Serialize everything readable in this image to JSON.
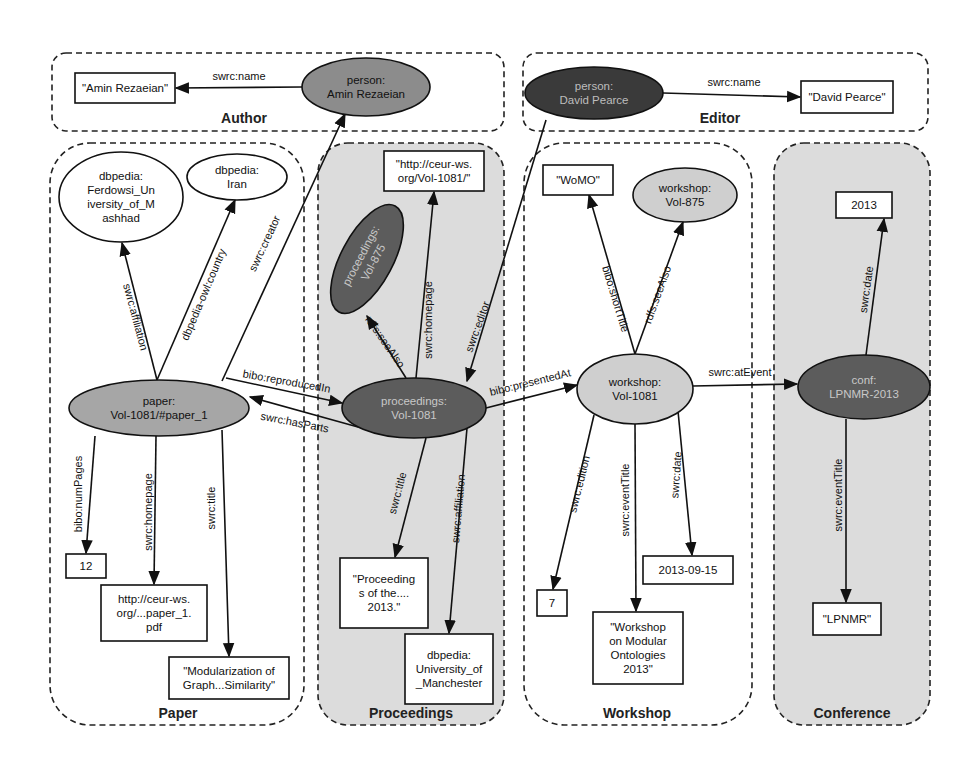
{
  "groups": [
    {
      "id": "author",
      "label": "Author",
      "fill": "#ffffff"
    },
    {
      "id": "editor",
      "label": "Editor",
      "fill": "#ffffff"
    },
    {
      "id": "paper",
      "label": "Paper",
      "fill": "#ffffff"
    },
    {
      "id": "proceedings",
      "label": "Proceedings",
      "fill": "#dcdcdc"
    },
    {
      "id": "workshop",
      "label": "Workshop",
      "fill": "#ffffff"
    },
    {
      "id": "conference",
      "label": "Conference",
      "fill": "#dcdcdc"
    }
  ],
  "nodes": [
    {
      "id": "amin-literal",
      "shape": "rect",
      "lines": [
        "\"Amin Rezaeian\""
      ],
      "fill": "#ffffff",
      "text_color": "#111111"
    },
    {
      "id": "person-amin",
      "shape": "ellipse",
      "lines": [
        "person:",
        "Amin Rezaeian"
      ],
      "fill": "#8c8c8c",
      "text_color": "#111111"
    },
    {
      "id": "person-david",
      "shape": "ellipse",
      "lines": [
        "person:",
        "David Pearce"
      ],
      "fill": "#3a3a3a",
      "text_color": "#bdbdbd"
    },
    {
      "id": "david-literal",
      "shape": "rect",
      "lines": [
        "\"David Pearce\""
      ],
      "fill": "#ffffff",
      "text_color": "#111111"
    },
    {
      "id": "ferdowsi",
      "shape": "ellipse",
      "lines": [
        "dbpedia:",
        "Ferdowsi_Un",
        "iversity_of_M",
        "ashhad"
      ],
      "fill": "#ffffff",
      "text_color": "#111111"
    },
    {
      "id": "iran",
      "shape": "ellipse",
      "lines": [
        "dbpedia:",
        "Iran"
      ],
      "fill": "#ffffff",
      "text_color": "#111111"
    },
    {
      "id": "paper",
      "shape": "ellipse",
      "lines": [
        "paper:",
        "Vol-1081/#paper_1"
      ],
      "fill": "#a6a6a6",
      "text_color": "#111111"
    },
    {
      "id": "num-pages",
      "shape": "rect",
      "lines": [
        "12"
      ],
      "fill": "#ffffff",
      "text_color": "#111111"
    },
    {
      "id": "paper-homepage",
      "shape": "rect",
      "lines": [
        "http://ceur-ws.",
        "org/...paper_1.",
        "pdf"
      ],
      "fill": "#ffffff",
      "text_color": "#111111"
    },
    {
      "id": "paper-title",
      "shape": "rect",
      "lines": [
        "\"Modularization of",
        "Graph...Similarity\""
      ],
      "fill": "#ffffff",
      "text_color": "#111111"
    },
    {
      "id": "proc-homepage",
      "shape": "rect",
      "lines": [
        "\"http://ceur-ws.",
        "org/Vol-1081/\""
      ],
      "fill": "#ffffff",
      "text_color": "#111111"
    },
    {
      "id": "proc-875",
      "shape": "ellipse",
      "lines": [
        "proceedings:",
        "Vol-875"
      ],
      "fill": "#5c5c5c",
      "text_color": "#c8c8c8"
    },
    {
      "id": "proc-1081",
      "shape": "ellipse",
      "lines": [
        "proceedings:",
        "Vol-1081"
      ],
      "fill": "#5c5c5c",
      "text_color": "#c8c8c8"
    },
    {
      "id": "proc-title",
      "shape": "rect",
      "lines": [
        "\"Proceeding",
        "s of the....",
        "2013.\""
      ],
      "fill": "#ffffff",
      "text_color": "#111111"
    },
    {
      "id": "manchester",
      "shape": "rect",
      "lines": [
        "dbpedia:",
        "University_of",
        "_Manchester"
      ],
      "fill": "#ffffff",
      "text_color": "#111111"
    },
    {
      "id": "womo",
      "shape": "rect",
      "lines": [
        "\"WoMO\""
      ],
      "fill": "#ffffff",
      "text_color": "#111111"
    },
    {
      "id": "workshop-875",
      "shape": "ellipse",
      "lines": [
        "workshop:",
        "Vol-875"
      ],
      "fill": "#cfcfcf",
      "text_color": "#111111"
    },
    {
      "id": "workshop-1081",
      "shape": "ellipse",
      "lines": [
        "workshop:",
        "Vol-1081"
      ],
      "fill": "#cfcfcf",
      "text_color": "#111111"
    },
    {
      "id": "edition",
      "shape": "rect",
      "lines": [
        "7"
      ],
      "fill": "#ffffff",
      "text_color": "#111111"
    },
    {
      "id": "ws-date",
      "shape": "rect",
      "lines": [
        "2013-09-15"
      ],
      "fill": "#ffffff",
      "text_color": "#111111"
    },
    {
      "id": "ws-title",
      "shape": "rect",
      "lines": [
        "\"Workshop",
        "on Modular",
        "Ontologies",
        "2013\""
      ],
      "fill": "#ffffff",
      "text_color": "#111111"
    },
    {
      "id": "conf-year",
      "shape": "rect",
      "lines": [
        "2013"
      ],
      "fill": "#ffffff",
      "text_color": "#111111"
    },
    {
      "id": "conf",
      "shape": "ellipse",
      "lines": [
        "conf:",
        "LPNMR-2013"
      ],
      "fill": "#5c5c5c",
      "text_color": "#c8c8c8"
    },
    {
      "id": "lpnmr",
      "shape": "rect",
      "lines": [
        "\"LPNMR\""
      ],
      "fill": "#ffffff",
      "text_color": "#111111"
    }
  ],
  "edges": [
    {
      "from": "person-amin",
      "to": "amin-literal",
      "label": "swrc:name"
    },
    {
      "from": "person-david",
      "to": "david-literal",
      "label": "swrc:name"
    },
    {
      "from": "paper",
      "to": "ferdowsi",
      "label": "swrc:affiliation"
    },
    {
      "from": "paper",
      "to": "iran",
      "label": "dbpedia-owl:country"
    },
    {
      "from": "paper",
      "to": "person-amin",
      "label": "swrc:creator"
    },
    {
      "from": "paper",
      "to": "proc-1081",
      "label": "bibo:reproducedIn"
    },
    {
      "from": "proc-1081",
      "to": "paper",
      "label": "swrc:hasParts"
    },
    {
      "from": "paper",
      "to": "num-pages",
      "label": "bibo:numPages"
    },
    {
      "from": "paper",
      "to": "paper-homepage",
      "label": "swrc:homepage"
    },
    {
      "from": "paper",
      "to": "paper-title",
      "label": "swrc:title"
    },
    {
      "from": "proc-1081",
      "to": "proc-homepage",
      "label": "swrc:homepage"
    },
    {
      "from": "proc-1081",
      "to": "proc-875",
      "label": "rdfs:seeAlso"
    },
    {
      "from": "person-david",
      "to": "proc-1081",
      "label": "swrc:editor"
    },
    {
      "from": "proc-1081",
      "to": "proc-title",
      "label": "swrc:title"
    },
    {
      "from": "proc-1081",
      "to": "manchester",
      "label": "swrc:affiliation"
    },
    {
      "from": "proc-1081",
      "to": "workshop-1081",
      "label": "bibo:presentedAt"
    },
    {
      "from": "workshop-1081",
      "to": "womo",
      "label": "bibo:shortTitle"
    },
    {
      "from": "workshop-1081",
      "to": "workshop-875",
      "label": "rdfs:seeAlso"
    },
    {
      "from": "workshop-1081",
      "to": "edition",
      "label": "swrc:edition"
    },
    {
      "from": "workshop-1081",
      "to": "ws-title",
      "label": "swrc:eventTitle"
    },
    {
      "from": "workshop-1081",
      "to": "ws-date",
      "label": "swrc:date"
    },
    {
      "from": "workshop-1081",
      "to": "conf",
      "label": "swrc:atEvent"
    },
    {
      "from": "conf",
      "to": "conf-year",
      "label": "swrc:date"
    },
    {
      "from": "conf",
      "to": "lpnmr",
      "label": "swrc:eventTitle"
    }
  ]
}
